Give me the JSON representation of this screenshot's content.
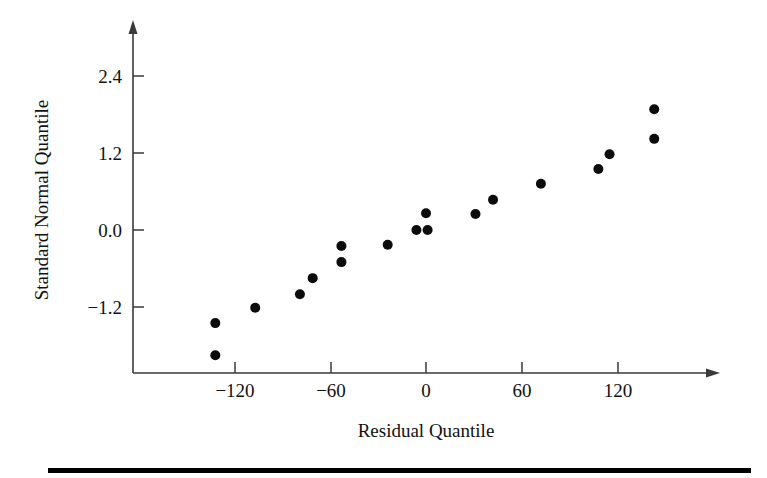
{
  "chart_data": {
    "type": "scatter",
    "title": "",
    "subtitle": "",
    "xlabel": "Residual Quantile",
    "ylabel": "Standard Normal Quantile",
    "xlim": [
      -160,
      165
    ],
    "ylim": [
      -2.25,
      2.95
    ],
    "xticks": [
      -120,
      -60,
      0,
      60,
      120
    ],
    "xtick_labels": [
      "−120",
      "−60",
      "0",
      "60",
      "120"
    ],
    "yticks": [
      -1.2,
      0.0,
      1.2,
      2.4
    ],
    "ytick_labels": [
      "−1.2",
      "0.0",
      "1.2",
      "2.4"
    ],
    "grid": false,
    "legend": null,
    "marker": "filled-circle",
    "marker_color": "#0c0c0c",
    "n_points": 18,
    "points": [
      {
        "x": -132,
        "y": -1.95
      },
      {
        "x": -132,
        "y": -1.45
      },
      {
        "x": -107,
        "y": -1.21
      },
      {
        "x": -79,
        "y": -1.0
      },
      {
        "x": -71,
        "y": -0.75
      },
      {
        "x": -53,
        "y": -0.5
      },
      {
        "x": -53,
        "y": -0.25
      },
      {
        "x": -24,
        "y": -0.23
      },
      {
        "x": -6,
        "y": 0.0
      },
      {
        "x": 1,
        "y": 0.0
      },
      {
        "x": 0,
        "y": 0.26
      },
      {
        "x": 31,
        "y": 0.25
      },
      {
        "x": 42,
        "y": 0.47
      },
      {
        "x": 72,
        "y": 0.72
      },
      {
        "x": 108,
        "y": 0.95
      },
      {
        "x": 115,
        "y": 1.18
      },
      {
        "x": 143,
        "y": 1.42
      },
      {
        "x": 143,
        "y": 1.88
      }
    ]
  },
  "axes": {
    "x_axis_title": "Residual Quantile",
    "y_axis_title": "Standard Normal Quantile",
    "x_tick_labels": [
      "−120",
      "−60",
      "0",
      "60",
      "120"
    ],
    "y_tick_labels": [
      "2.4",
      "1.2",
      "0.0",
      "−1.2"
    ]
  },
  "colors": {
    "marker": "#0c0c0c",
    "axis": "#3a3a3a",
    "text": "#111111",
    "rule": "#000000",
    "background": "#ffffff"
  }
}
